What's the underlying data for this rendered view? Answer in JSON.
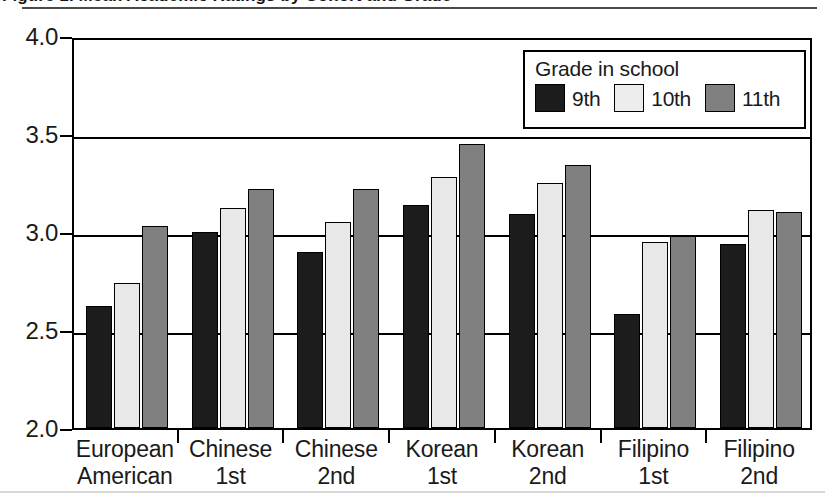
{
  "figure": {
    "title": "Figure 1. Mean Academic Ratings by Cohort and Grade",
    "title_visible_fragment": "…ings by cohort grade"
  },
  "legend": {
    "title": "Grade in school",
    "items": [
      {
        "label": "9th",
        "color": "#1c1c1c"
      },
      {
        "label": "10th",
        "color": "#ededed"
      },
      {
        "label": "11th",
        "color": "#808080"
      }
    ]
  },
  "chart_data": {
    "type": "bar",
    "title": "",
    "xlabel": "",
    "ylabel": "",
    "ylim": [
      2.0,
      4.0
    ],
    "ytick_labels": [
      "4.0",
      "3.5",
      "3.0",
      "2.5",
      "2.0"
    ],
    "ytick_values": [
      4.0,
      3.5,
      3.0,
      2.5,
      2.0
    ],
    "grid": true,
    "legend_position": "top-right-inside",
    "categories": [
      {
        "line1": "European",
        "line2": "American"
      },
      {
        "line1": "Chinese",
        "line2": "1st"
      },
      {
        "line1": "Chinese",
        "line2": "2nd"
      },
      {
        "line1": "Korean",
        "line2": "1st"
      },
      {
        "line1": "Korean",
        "line2": "2nd"
      },
      {
        "line1": "Filipino",
        "line2": "1st"
      },
      {
        "line1": "Filipino",
        "line2": "2nd"
      }
    ],
    "category_labels": [
      "European American",
      "Chinese 1st",
      "Chinese 2nd",
      "Korean 1st",
      "Korean 2nd",
      "Filipino 1st",
      "Filipino 2nd"
    ],
    "series": [
      {
        "name": "9th",
        "color": "#1c1c1c",
        "values": [
          2.62,
          3.0,
          2.9,
          3.14,
          3.09,
          2.58,
          2.94
        ]
      },
      {
        "name": "10th",
        "color": "#ededed",
        "values": [
          2.74,
          3.12,
          3.05,
          3.28,
          3.25,
          2.95,
          3.11
        ]
      },
      {
        "name": "11th",
        "color": "#808080",
        "values": [
          3.03,
          3.22,
          3.22,
          3.45,
          3.34,
          2.98,
          3.1
        ]
      }
    ]
  }
}
